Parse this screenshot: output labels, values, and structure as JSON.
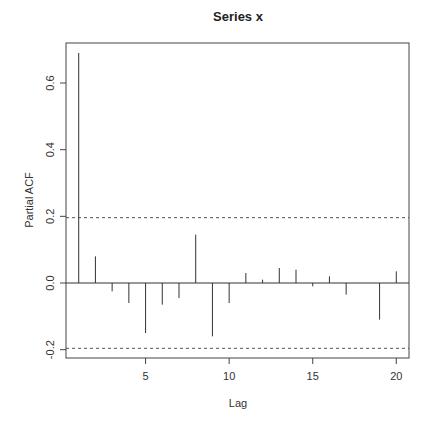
{
  "chart_data": {
    "type": "bar",
    "subtype": "pacf-spike",
    "title": "Series  x",
    "xlabel": "Lag",
    "ylabel": "Partial ACF",
    "x": [
      1,
      2,
      3,
      4,
      5,
      6,
      7,
      8,
      9,
      10,
      11,
      12,
      13,
      14,
      15,
      16,
      17,
      18,
      19,
      20
    ],
    "values": [
      0.69,
      0.08,
      -0.025,
      -0.06,
      -0.15,
      -0.065,
      -0.045,
      0.145,
      -0.16,
      -0.06,
      0.03,
      0.01,
      0.045,
      0.04,
      -0.01,
      0.02,
      -0.035,
      0.0,
      -0.11,
      0.035
    ],
    "confidence_limit": 0.196,
    "xlim": [
      0.24,
      20.76
    ],
    "ylim": [
      -0.225,
      0.72
    ],
    "xticks": [
      5,
      10,
      15,
      20
    ],
    "xtick_labels": [
      "5",
      "10",
      "15",
      "20"
    ],
    "yticks": [
      -0.2,
      0.0,
      0.2,
      0.4,
      0.6
    ],
    "ytick_labels": [
      "-0.2",
      "0.0",
      "0.2",
      "0.4",
      "0.6"
    ],
    "grid": false,
    "legend": null,
    "colors": {
      "spike": "#333333",
      "ci_line": "#555555",
      "axis": "#444444"
    }
  }
}
